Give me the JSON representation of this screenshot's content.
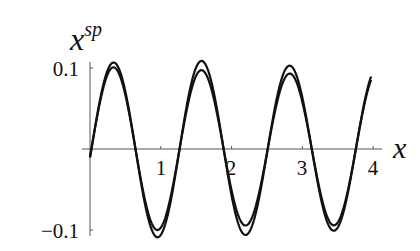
{
  "chart_data": {
    "type": "line",
    "title": "",
    "xlabel": "x",
    "ylabel": "x^sp",
    "ylabel_base": "x",
    "ylabel_sup": "sp",
    "xlim": [
      0,
      4.1
    ],
    "ylim": [
      -0.11,
      0.11
    ],
    "x_ticks": [
      1,
      2,
      3,
      4
    ],
    "x_tick_labels": [
      "1",
      "2",
      "3",
      "4"
    ],
    "y_ticks": [
      0.1,
      -0.1
    ],
    "y_tick_labels": [
      "0.1",
      "−0.1"
    ],
    "grid": false,
    "legend": null,
    "series": [
      {
        "name": "outer curve",
        "description": "oscillation with slightly larger amplitude",
        "amplitude": 0.105,
        "period": 1.245,
        "phase_x0": 0.02,
        "x": [
          0,
          0.35,
          0.98,
          1.6,
          2.25,
          2.85,
          3.5,
          3.97
        ],
        "values": [
          -0.02,
          0.105,
          -0.085,
          0.1,
          -0.094,
          0.105,
          -0.104,
          0.075
        ]
      },
      {
        "name": "inner curve",
        "description": "oscillation with slightly smaller amplitude",
        "amplitude": 0.097,
        "period": 1.245,
        "phase_x0": 0.02,
        "x": [
          0,
          0.35,
          0.98,
          1.6,
          2.25,
          2.85,
          3.5,
          3.97
        ],
        "values": [
          -0.02,
          0.096,
          -0.075,
          0.098,
          -0.085,
          0.1,
          -0.095,
          0.07
        ]
      }
    ]
  }
}
